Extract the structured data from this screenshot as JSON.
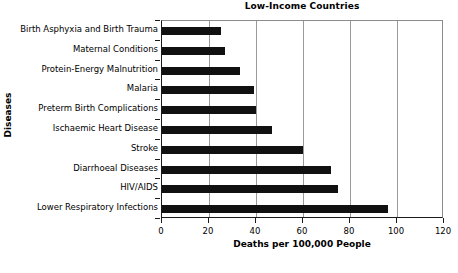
{
  "chart_data": {
    "type": "bar",
    "orientation": "horizontal",
    "title": "Low-Income Countries",
    "xlabel": "Deaths per 100,000 People",
    "ylabel": "Diseases",
    "xlim": [
      0,
      120
    ],
    "xticks": [
      0,
      20,
      40,
      60,
      80,
      100,
      120
    ],
    "xtick_labels": [
      "0",
      "20",
      "40",
      "60",
      "80",
      "100",
      "120"
    ],
    "grid": "vertical",
    "legend": "none",
    "bar_color": "#111111",
    "categories": [
      "Birth Asphyxia and Birth Trauma",
      "Maternal Conditions",
      "Protein-Energy Malnutrition",
      "Malaria",
      "Preterm Birth Complications",
      "Ischaemic Heart Disease",
      "Stroke",
      "Diarrhoeal Diseases",
      "HIV/AIDS",
      "Lower Respiratory Infections"
    ],
    "values": [
      25,
      27,
      33,
      39,
      40,
      47,
      60,
      72,
      75,
      96
    ]
  }
}
